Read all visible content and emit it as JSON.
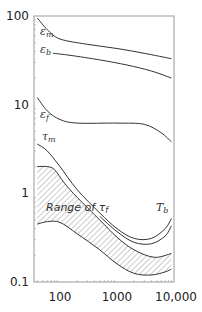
{
  "chart_data": {
    "type": "line",
    "title": "",
    "xlabel": "",
    "ylabel": "",
    "x_scale": "log",
    "y_scale": "log",
    "xlim": [
      35,
      10000
    ],
    "ylim": [
      0.1,
      100
    ],
    "grid": false,
    "legend": "none (inline curve labels)",
    "x_ticks": [
      {
        "value": 100,
        "label": "100"
      },
      {
        "value": 1000,
        "label": "1000"
      },
      {
        "value": 10000,
        "label": "10,000"
      }
    ],
    "y_ticks": [
      {
        "value": 100,
        "label": "100"
      },
      {
        "value": 10,
        "label": "10"
      },
      {
        "value": 1,
        "label": "1"
      },
      {
        "value": 0.1,
        "label": "0.1"
      }
    ],
    "series": [
      {
        "name": "ε_m",
        "label_base": "ε",
        "label_sub": "m",
        "points": [
          [
            40,
            95
          ],
          [
            60,
            70
          ],
          [
            100,
            55
          ],
          [
            300,
            48
          ],
          [
            1000,
            43
          ],
          [
            3000,
            38
          ],
          [
            9000,
            33
          ]
        ]
      },
      {
        "name": "ε_b",
        "label_base": "ε",
        "label_sub": "b",
        "points": [
          [
            75,
            38
          ],
          [
            150,
            36
          ],
          [
            500,
            32
          ],
          [
            1500,
            28
          ],
          [
            4000,
            24
          ],
          [
            9000,
            20
          ]
        ]
      },
      {
        "name": "ε_f",
        "label_base": "ε",
        "label_sub": "f",
        "points": [
          [
            40,
            12
          ],
          [
            60,
            8.5
          ],
          [
            100,
            6.8
          ],
          [
            200,
            6.2
          ],
          [
            1000,
            6.2
          ],
          [
            3000,
            6.0
          ],
          [
            6000,
            4.8
          ],
          [
            9000,
            3.8
          ]
        ]
      },
      {
        "name": "τ_m",
        "label_base": "τ",
        "label_sub": "m",
        "points": [
          [
            40,
            3.6
          ],
          [
            60,
            3.0
          ],
          [
            100,
            2.0
          ],
          [
            200,
            1.1
          ],
          [
            500,
            0.6
          ],
          [
            1000,
            0.4
          ],
          [
            2000,
            0.31
          ],
          [
            4000,
            0.31
          ],
          [
            7000,
            0.4
          ],
          [
            9000,
            0.52
          ]
        ]
      },
      {
        "name": "T_b",
        "label_base": "T",
        "label_sub": "b",
        "points": [
          [
            500,
            0.55
          ],
          [
            1000,
            0.37
          ],
          [
            2000,
            0.28
          ],
          [
            4000,
            0.27
          ],
          [
            7000,
            0.33
          ],
          [
            9000,
            0.43
          ]
        ]
      },
      {
        "name": "Range of τ_f (upper bound)",
        "points": [
          [
            40,
            2.0
          ],
          [
            60,
            2.0
          ],
          [
            80,
            1.85
          ],
          [
            120,
            1.3
          ],
          [
            200,
            0.9
          ],
          [
            500,
            0.5
          ],
          [
            1000,
            0.32
          ],
          [
            2000,
            0.23
          ],
          [
            4500,
            0.19
          ],
          [
            9000,
            0.21
          ]
        ]
      },
      {
        "name": "Range of τ_f (lower bound)",
        "points": [
          [
            40,
            0.45
          ],
          [
            60,
            0.48
          ],
          [
            100,
            0.47
          ],
          [
            200,
            0.35
          ],
          [
            500,
            0.23
          ],
          [
            1000,
            0.16
          ],
          [
            2000,
            0.125
          ],
          [
            4000,
            0.12
          ],
          [
            7000,
            0.13
          ],
          [
            9000,
            0.14
          ]
        ]
      }
    ],
    "annotations": [
      {
        "text": "Range of τ",
        "sub": "f",
        "note": "hatched region between upper and lower bounds"
      }
    ]
  },
  "labels": {
    "range_prefix": "Range of τ",
    "range_sub": "f"
  }
}
